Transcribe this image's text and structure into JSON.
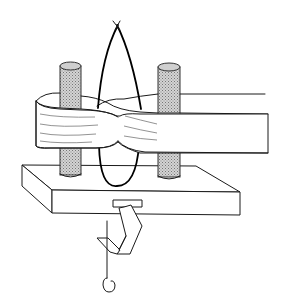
{
  "figure": {
    "description": "Line drawing of a flexible band looped in a figure-eight around two shaded vertical posts mounted on a rectangular base plate, with a thin wire loop passing through the crossover and a hook-and-clamp hanging from the base plate",
    "components": [
      {
        "id": "left-post",
        "label": "Left post"
      },
      {
        "id": "right-post",
        "label": "Right post"
      },
      {
        "id": "band",
        "label": "Figure-eight band"
      },
      {
        "id": "wire-loop",
        "label": "Wire loop"
      },
      {
        "id": "base-plate",
        "label": "Base plate"
      },
      {
        "id": "clamp",
        "label": "Clamp"
      },
      {
        "id": "hook",
        "label": "Hook"
      }
    ],
    "colors": {
      "line": "#1a1a1a",
      "post_fill": "#b8b8b8",
      "background": "#ffffff"
    }
  }
}
